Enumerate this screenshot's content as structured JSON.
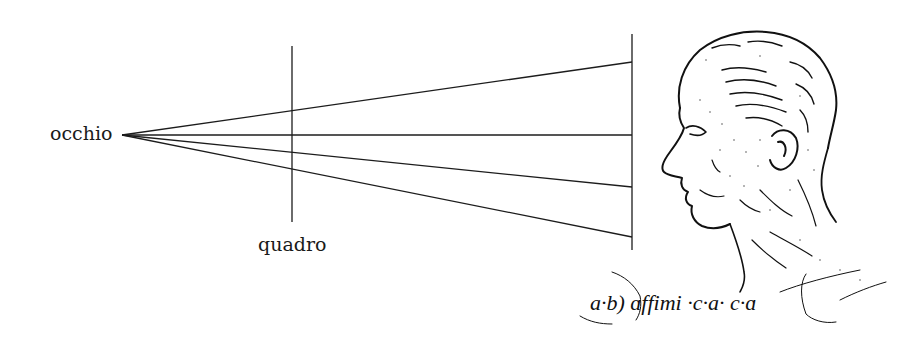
{
  "diagram": {
    "labels": {
      "eye": "occhio",
      "picture_plane": "quadro"
    },
    "handwriting": "a·b) ɑffimi ·c·a· c·ɑ",
    "colors": {
      "background": "#ffffff",
      "ink": "#1c1c1c"
    },
    "geometry": {
      "eye_point": [
        122,
        135
      ],
      "picture_plane": {
        "x": 292,
        "y_top": 46,
        "y_bottom": 222
      },
      "object_plane": {
        "x": 632,
        "y_top": 34,
        "y_bottom": 250
      },
      "ray_endpoints_y": [
        62,
        135,
        187,
        237
      ]
    },
    "figure": "profile-head-sketch"
  }
}
